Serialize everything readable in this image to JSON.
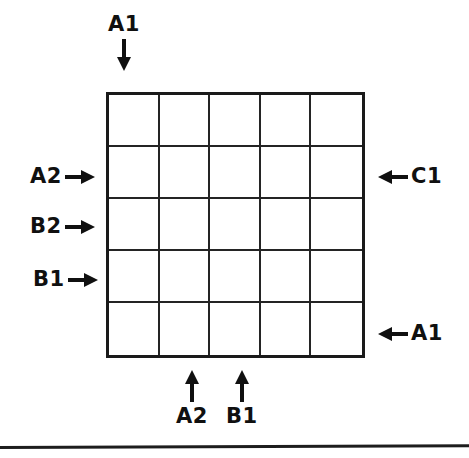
{
  "figure": {
    "type": "annotated-grid-diagram",
    "grid": {
      "rows": 5,
      "columns": 5,
      "cells": [
        [
          "",
          "",
          "",
          "",
          ""
        ],
        [
          "",
          "",
          "",
          "",
          ""
        ],
        [
          "",
          "",
          "",
          "",
          ""
        ],
        [
          "",
          "",
          "",
          "",
          ""
        ],
        [
          "",
          "",
          "",
          "",
          ""
        ]
      ]
    },
    "line_color": "#242424",
    "border_color": "#1a1a1a",
    "text_color": "#101010",
    "background_color": "#ffffff",
    "annotations": {
      "top": [
        {
          "label": "A1",
          "arrow": "down-arrow-icon",
          "target_column": 1
        }
      ],
      "left": [
        {
          "label": "A2",
          "arrow": "right-arrow-icon",
          "target_row": 2
        },
        {
          "label": "B2",
          "arrow": "right-arrow-icon",
          "target_row": 3
        },
        {
          "label": "B1",
          "arrow": "right-arrow-icon",
          "target_row": 4
        }
      ],
      "right": [
        {
          "label": "C1",
          "arrow": "left-arrow-icon",
          "target_row": 2
        },
        {
          "label": "A1",
          "arrow": "left-arrow-icon",
          "target_row": 5
        }
      ],
      "bottom": [
        {
          "label": "A2",
          "arrow": "up-arrow-icon",
          "target_column": 2
        },
        {
          "label": "B1",
          "arrow": "up-arrow-icon",
          "target_column": 3
        }
      ]
    }
  }
}
